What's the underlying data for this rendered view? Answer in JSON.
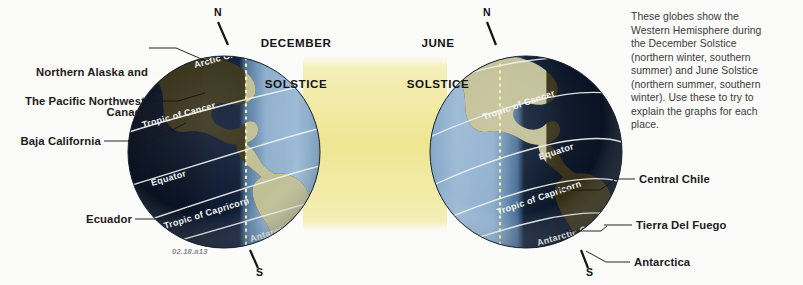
{
  "figure": {
    "id_label": "02.18.a13",
    "caption_lines": [
      "These globes show the",
      "Western Hemisphere during",
      "the December Solstice",
      "(northern winter, southern",
      "summer) and June Solstice",
      "(northern summer, southern",
      "winter). Use these to try to",
      "explain the graphs for each",
      "place."
    ]
  },
  "globes": [
    {
      "key": "december",
      "title_line1": "DECEMBER",
      "title_line2": "SOLSTICE",
      "north_pole_label": "N",
      "south_pole_label": "S",
      "lit_side": "right",
      "graticules": [
        {
          "name": "arctic-circle",
          "label": "Arctic C."
        },
        {
          "name": "tropic-of-cancer",
          "label": "Tropic of Cancer"
        },
        {
          "name": "equator",
          "label": "Equator"
        },
        {
          "name": "tropic-of-capricorn",
          "label": "Tropic of Capricorn"
        },
        {
          "name": "antarctic-circle",
          "label": "Antarctic C."
        }
      ]
    },
    {
      "key": "june",
      "title_line1": "JUNE",
      "title_line2": "SOLSTICE",
      "north_pole_label": "N",
      "south_pole_label": "S",
      "lit_side": "left",
      "graticules": [
        {
          "name": "arctic-circle",
          "label": "Arctic C."
        },
        {
          "name": "tropic-of-cancer",
          "label": "Tropic of Cancer"
        },
        {
          "name": "equator",
          "label": "Equator"
        },
        {
          "name": "tropic-of-capricorn",
          "label": "Tropic of Capricorn"
        },
        {
          "name": "antarctic-circle",
          "label": "Antarctic C."
        }
      ]
    }
  ],
  "callouts": {
    "left": [
      {
        "name": "northern-alaska-and-canada",
        "line1": "Northern Alaska and",
        "line2": "Canada"
      },
      {
        "name": "the-pacific-northwest",
        "line1": "The Pacific Northwest",
        "line2": ""
      },
      {
        "name": "baja-california",
        "line1": "Baja California",
        "line2": ""
      },
      {
        "name": "ecuador",
        "line1": "Ecuador",
        "line2": ""
      }
    ],
    "right": [
      {
        "name": "central-chile",
        "line1": "Central Chile"
      },
      {
        "name": "tierra-del-fuego",
        "line1": "Tierra Del Fuego"
      },
      {
        "name": "antarctica",
        "line1": "Antarctica"
      }
    ]
  },
  "colors": {
    "page_background": "#fbfbfa",
    "sunlight_band": "#f0e79a",
    "globe_dark": "#0d1626",
    "globe_lit_ocean": "#93b2cf",
    "globe_land_lit": "#cfcfa4",
    "globe_land_dark": "#3b3520",
    "graticule_line": "#eef2f0",
    "terminator_dash": "#f3f5a8",
    "label_text": "#1b1b1b",
    "caption_text": "#3a3a3a",
    "figure_id_text": "#8d8d8d",
    "leader_line": "#171717"
  }
}
